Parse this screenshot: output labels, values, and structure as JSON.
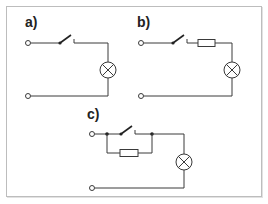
{
  "figure": {
    "panels": [
      {
        "id": "a",
        "label": "a)",
        "components": [
          "terminal",
          "switch (open)",
          "lamp",
          "terminal"
        ],
        "topology": "series: switch + lamp"
      },
      {
        "id": "b",
        "label": "b)",
        "components": [
          "terminal",
          "switch (open)",
          "resistor",
          "lamp",
          "terminal"
        ],
        "topology": "series: switch + resistor + lamp"
      },
      {
        "id": "c",
        "label": "c)",
        "components": [
          "terminal",
          "switch (open)",
          "resistor",
          "lamp",
          "terminal"
        ],
        "topology": "switch in parallel with resistor, in series with lamp"
      }
    ]
  },
  "colors": {
    "line": "#3a3a3a",
    "frame": "#bdbdbd",
    "background": "#ffffff"
  },
  "icons": {
    "terminal": "open-circle",
    "switch": "open-switch",
    "resistor": "rectangle",
    "lamp": "circle-with-x",
    "junction": "filled-dot"
  }
}
